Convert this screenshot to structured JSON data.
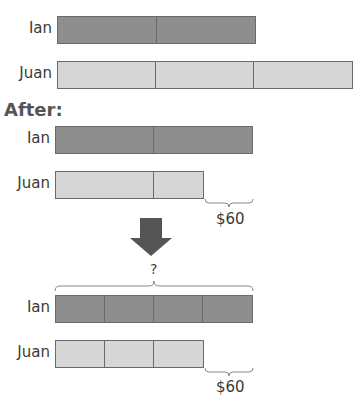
{
  "before": {
    "rows": [
      {
        "name": "Ian",
        "units": 2,
        "shade": "dark"
      },
      {
        "name": "Juan",
        "units": 3,
        "shade": "light"
      }
    ]
  },
  "after": {
    "heading": "After:",
    "rows": [
      {
        "name": "Ian",
        "units": 2,
        "shade": "dark"
      },
      {
        "name": "Juan",
        "units": 1.5,
        "shade": "light"
      }
    ],
    "difference_label": "$60"
  },
  "arrow": {
    "direction": "down",
    "color": "#555555"
  },
  "final": {
    "total_label": "?",
    "rows": [
      {
        "name": "Ian",
        "units": 4,
        "shade": "dark"
      },
      {
        "name": "Juan",
        "units": 3,
        "shade": "light"
      }
    ],
    "difference_label": "$60"
  },
  "colors": {
    "dark": "#8e8e8e",
    "light": "#d6d6d6",
    "border": "#6a6a6a"
  }
}
